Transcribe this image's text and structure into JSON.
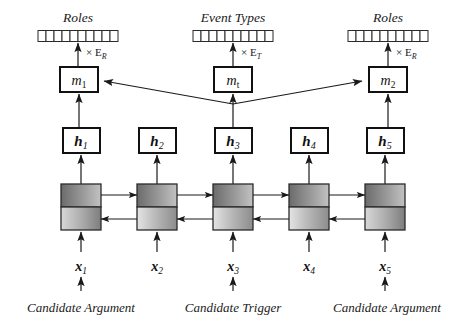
{
  "figure": {
    "background_color": "#ffffff",
    "ink_color": "#1a1a1a"
  },
  "output_layer": {
    "groups": [
      {
        "id": "roles-left",
        "heading": "Roles",
        "cell_count": 10,
        "multiplier_label": "× E",
        "multiplier_sub": "R",
        "x_center": 78
      },
      {
        "id": "event-types",
        "heading": "Event Types",
        "cell_count": 10,
        "multiplier_label": "× E",
        "multiplier_sub": "T",
        "x_center": 233
      },
      {
        "id": "roles-right",
        "heading": "Roles",
        "cell_count": 10,
        "multiplier_label": "× E",
        "multiplier_sub": "R",
        "x_center": 388
      }
    ]
  },
  "memory_layer": {
    "nodes": [
      {
        "id": "m1",
        "base": "m",
        "sub": "1",
        "x_center": 78
      },
      {
        "id": "mt",
        "base": "m",
        "sub": "t",
        "x_center": 233
      },
      {
        "id": "m2",
        "base": "m",
        "sub": "2",
        "x_center": 388
      }
    ]
  },
  "hidden_layer": {
    "nodes": [
      {
        "id": "h1",
        "base": "h",
        "sub": "1",
        "x_center": 81
      },
      {
        "id": "h2",
        "base": "h",
        "sub": "2",
        "x_center": 157
      },
      {
        "id": "h3",
        "base": "h",
        "sub": "3",
        "x_center": 233
      },
      {
        "id": "h4",
        "base": "h",
        "sub": "4",
        "x_center": 309
      },
      {
        "id": "h5",
        "base": "h",
        "sub": "5",
        "x_center": 385
      }
    ]
  },
  "rnn_layer": {
    "cell_count": 5,
    "direction_top": "forward",
    "direction_bottom": "backward",
    "top_fill_start": "#6f6f6f",
    "top_fill_end": "#b8b8b8",
    "bottom_fill_start": "#e2e2e2",
    "bottom_fill_end": "#8f8f8f"
  },
  "input_layer": {
    "nodes": [
      {
        "id": "x1",
        "base": "x",
        "sub": "1",
        "x_center": 81,
        "has_input_arrow": true
      },
      {
        "id": "x2",
        "base": "x",
        "sub": "2",
        "x_center": 157,
        "has_input_arrow": false
      },
      {
        "id": "x3",
        "base": "x",
        "sub": "3",
        "x_center": 233,
        "has_input_arrow": true
      },
      {
        "id": "x4",
        "base": "x",
        "sub": "4",
        "x_center": 309,
        "has_input_arrow": false
      },
      {
        "id": "x5",
        "base": "x",
        "sub": "5",
        "x_center": 385,
        "has_input_arrow": true
      }
    ]
  },
  "captions": [
    {
      "id": "caption-left",
      "text": "Candidate Argument",
      "x_center": 81
    },
    {
      "id": "caption-center",
      "text": "Candidate Trigger",
      "x_center": 233
    },
    {
      "id": "caption-right",
      "text": "Candidate Argument",
      "x_center": 387
    }
  ]
}
